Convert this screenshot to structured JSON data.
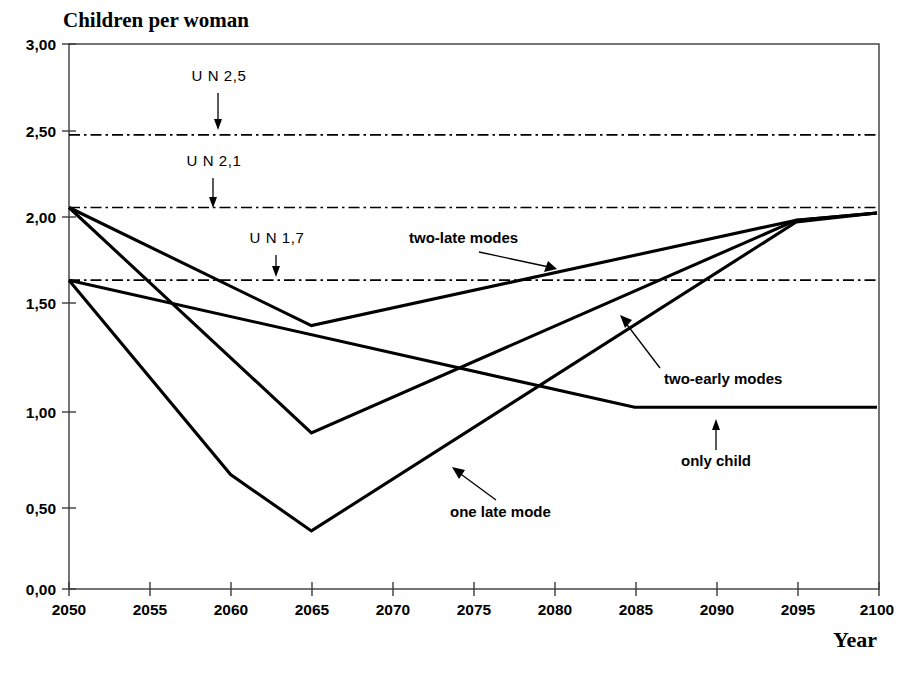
{
  "chart_data": {
    "type": "line",
    "title": "Children per woman",
    "xlabel": "Year",
    "ylabel": "",
    "xlim": [
      2050,
      2100
    ],
    "ylim": [
      0,
      3
    ],
    "grid": false,
    "legend": "inline-annotations",
    "x_ticks": [
      "2050",
      "2055",
      "2060",
      "2065",
      "2070",
      "2075",
      "2080",
      "2085",
      "2090",
      "2095",
      "2100"
    ],
    "y_ticks": [
      "0,00",
      "0,50",
      "1,00",
      "1,50",
      "2,00",
      "2,50",
      "3,00"
    ],
    "x": [
      2050,
      2055,
      2060,
      2065,
      2070,
      2075,
      2080,
      2085,
      2090,
      2095,
      2100
    ],
    "series": [
      {
        "name": "two-late modes",
        "x": [
          2050,
          2065,
          2095,
          2100
        ],
        "values": [
          2.1,
          1.45,
          2.03,
          2.07
        ]
      },
      {
        "name": "two-early modes",
        "x": [
          2050,
          2065,
          2095,
          2100
        ],
        "values": [
          2.1,
          0.86,
          2.03,
          2.07
        ]
      },
      {
        "name": "one late mode",
        "x": [
          2050,
          2060,
          2065,
          2095,
          2100
        ],
        "values": [
          1.7,
          0.63,
          0.32,
          2.02,
          2.07
        ]
      },
      {
        "name": "only child",
        "x": [
          2050,
          2085,
          2100
        ],
        "values": [
          1.7,
          1.0,
          1.0
        ]
      }
    ],
    "reference_lines": [
      {
        "label": "U N 2,5",
        "value": 2.5,
        "style": "dash-dot"
      },
      {
        "label": "U N 2,1",
        "value": 2.1,
        "style": "dash-dot"
      },
      {
        "label": "U N 1,7",
        "value": 1.7,
        "style": "dash-dot"
      }
    ],
    "annotations": [
      {
        "label": "two-late modes",
        "points_to_series": "two-late modes"
      },
      {
        "label": "two-early modes",
        "points_to_series": "two-early modes"
      },
      {
        "label": "one late mode",
        "points_to_series": "one late mode"
      },
      {
        "label": "only child",
        "points_to_series": "only child"
      }
    ],
    "colors": {
      "lines": "#000000",
      "frame": "#3a3a3a",
      "background": "#ffffff"
    }
  }
}
